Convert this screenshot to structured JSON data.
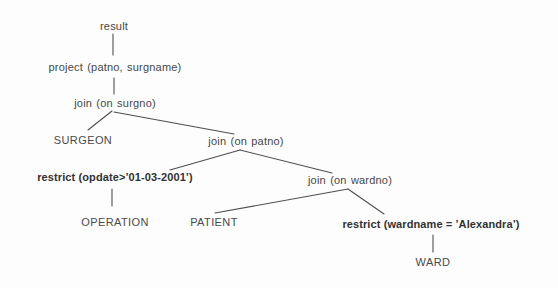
{
  "diagram": {
    "type": "tree",
    "nodes": {
      "result": {
        "label": "result"
      },
      "project": {
        "label": "project (patno, surgname)"
      },
      "join_surgno": {
        "label": "join (on surgno)"
      },
      "surgeon": {
        "label": "SURGEON"
      },
      "join_patno": {
        "label": "join (on patno)"
      },
      "restrict_opdate": {
        "label": "restrict (opdate>’01-03-2001’)"
      },
      "operation": {
        "label": "OPERATION"
      },
      "patient": {
        "label": "PATIENT"
      },
      "join_wardno": {
        "label": "join (on wardno)"
      },
      "restrict_wardname": {
        "label": "restrict (wardname = ’Alexandra’)"
      },
      "ward": {
        "label": "WARD"
      }
    },
    "edges": [
      {
        "from": "result",
        "to": "project"
      },
      {
        "from": "project",
        "to": "join_surgno"
      },
      {
        "from": "join_surgno",
        "to": "surgeon"
      },
      {
        "from": "join_surgno",
        "to": "join_patno"
      },
      {
        "from": "join_patno",
        "to": "restrict_opdate"
      },
      {
        "from": "join_patno",
        "to": "join_wardno"
      },
      {
        "from": "restrict_opdate",
        "to": "operation"
      },
      {
        "from": "join_wardno",
        "to": "patient"
      },
      {
        "from": "join_wardno",
        "to": "restrict_wardname"
      },
      {
        "from": "restrict_wardname",
        "to": "ward"
      }
    ],
    "colors": {
      "text": "#474747",
      "emphasis_text": "#323232",
      "line": "#4f4f4f",
      "background": "#fdfdfd"
    }
  }
}
